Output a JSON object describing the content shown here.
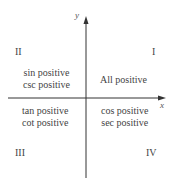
{
  "axes": {
    "x_label": "x",
    "y_label": "y",
    "color": "#333333"
  },
  "quadrants": {
    "I": {
      "numeral": "I",
      "lines": [
        "All positive"
      ]
    },
    "II": {
      "numeral": "II",
      "lines": [
        "sin positive",
        "csc positive"
      ]
    },
    "III": {
      "numeral": "III",
      "lines": [
        "tan positive",
        "cot positive"
      ]
    },
    "IV": {
      "numeral": "IV",
      "lines": [
        "cos positive",
        "sec positive"
      ]
    }
  }
}
